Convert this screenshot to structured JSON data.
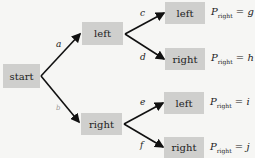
{
  "nodes": {
    "start": "start",
    "left": "left",
    "right": "right",
    "left_left": "left",
    "left_right": "right",
    "right_left": "left",
    "right_right": "right"
  },
  "edge_labels": {
    "a": "a",
    "b": "b",
    "c": "c",
    "d": "d",
    "e": "e",
    "f": "f"
  },
  "outcomes": [
    {
      "symbol": "P",
      "subscript": "right",
      "equals": "=",
      "value": "g"
    },
    {
      "symbol": "P",
      "subscript": "right",
      "equals": "=",
      "value": "h"
    },
    {
      "symbol": "P",
      "subscript": "right",
      "equals": "=",
      "value": "i"
    },
    {
      "symbol": "P",
      "subscript": "right",
      "equals": "=",
      "value": "j"
    }
  ]
}
